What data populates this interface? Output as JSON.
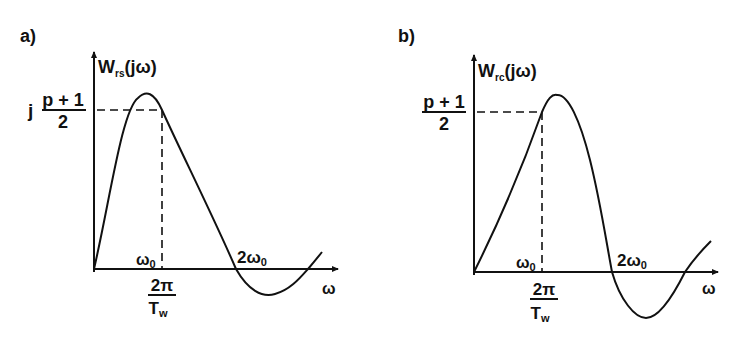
{
  "panels": [
    {
      "id": "a",
      "label": "a)",
      "y_axis_label": {
        "main": "W",
        "sub": "rs",
        "arg": "(jω)"
      },
      "level_label": {
        "prefix": "j",
        "numerator": "p + 1",
        "denominator": "2"
      },
      "omega0_label": {
        "main": "ω",
        "sub": "0"
      },
      "two_omega0_label": {
        "main": "2ω",
        "sub": "0"
      },
      "period_label": {
        "numerator": "2π",
        "denominator_main": "T",
        "denominator_sub": "w"
      },
      "x_axis_label": "ω"
    },
    {
      "id": "b",
      "label": "b)",
      "y_axis_label": {
        "main": "W",
        "sub": "rc",
        "arg": "(jω)"
      },
      "level_label": {
        "prefix": "",
        "numerator": "p + 1",
        "denominator": "2"
      },
      "omega0_label": {
        "main": "ω",
        "sub": "0"
      },
      "two_omega0_label": {
        "main": "2ω",
        "sub": "0"
      },
      "period_label": {
        "numerator": "2π",
        "denominator_main": "T",
        "denominator_sub": "w"
      },
      "x_axis_label": "ω"
    }
  ],
  "colors": {
    "ink": "#111111",
    "background": "#ffffff"
  }
}
